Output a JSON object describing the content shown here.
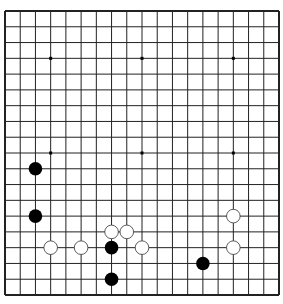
{
  "game": {
    "type": "go",
    "board_size": 19,
    "colors": {
      "background": "#ffffff",
      "line": "#222222",
      "black_stone": "#000000",
      "white_stone": "#ffffff",
      "white_stone_outline": "#333333"
    },
    "hoshi": [
      [
        3,
        3
      ],
      [
        9,
        3
      ],
      [
        15,
        3
      ],
      [
        3,
        9
      ],
      [
        9,
        9
      ],
      [
        15,
        9
      ],
      [
        3,
        15
      ],
      [
        9,
        15
      ],
      [
        15,
        15
      ]
    ],
    "stones": [
      {
        "color": "black",
        "col": 2,
        "row": 10
      },
      {
        "color": "black",
        "col": 2,
        "row": 13
      },
      {
        "color": "white",
        "col": 3,
        "row": 15
      },
      {
        "color": "white",
        "col": 5,
        "row": 15
      },
      {
        "color": "white",
        "col": 7,
        "row": 14
      },
      {
        "color": "white",
        "col": 8,
        "row": 14
      },
      {
        "color": "black",
        "col": 7,
        "row": 15
      },
      {
        "color": "white",
        "col": 9,
        "row": 15
      },
      {
        "color": "black",
        "col": 7,
        "row": 17
      },
      {
        "color": "white",
        "col": 15,
        "row": 13
      },
      {
        "color": "white",
        "col": 15,
        "row": 15
      },
      {
        "color": "black",
        "col": 13,
        "row": 16
      }
    ]
  }
}
